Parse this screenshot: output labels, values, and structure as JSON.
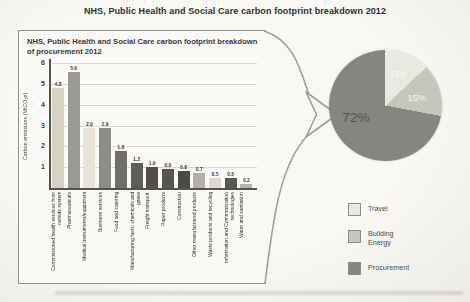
{
  "page": {
    "title": "NHS, Public Health and Social Care carbon footprint breakdown 2012"
  },
  "panel": {
    "title": "NHS, Public Health and Social Care carbon footprint breakdown of procurement 2012"
  },
  "colors": {
    "panel_border": "#91908a",
    "axis": "#55534e",
    "gridline": "#dad8d1",
    "page_background": "#f5f4ef"
  },
  "chart_data": [
    {
      "type": "bar",
      "title": "NHS, Public Health and Social Care carbon footprint breakdown of procurement 2012",
      "ylabel": "Carbon emissions (MtCO₂e)",
      "ylim": [
        0,
        6
      ],
      "yticks": [
        1,
        2,
        3,
        4,
        5,
        6
      ],
      "grid": true,
      "categories": [
        "Commissioned health services from outside system",
        "Pharmaceuticals",
        "Medical instruments/equipment",
        "Business services",
        "Food and catering",
        "Manufacturing fuels, chemicals and gases",
        "Freight transport",
        "Paper products",
        "Construction",
        "Other manufactured products",
        "Waste products and recycling",
        "Information and Communication technologies",
        "Water and sanitation"
      ],
      "values": [
        4.8,
        5.6,
        2.9,
        2.9,
        1.8,
        1.2,
        1.0,
        0.9,
        0.8,
        0.7,
        0.5,
        0.5,
        0.2
      ],
      "value_labels": [
        "4.8",
        "5.6",
        "2.9",
        "2.9",
        "1.8",
        "1.2",
        "1.0",
        "0.9",
        "0.8",
        "0.7",
        "0.5",
        "0.5",
        "0.2"
      ],
      "bar_colors": [
        "#d6d2c4",
        "#9a9994",
        "#e7e4d8",
        "#8d8c86",
        "#6f6e68",
        "#605e58",
        "#524f4a",
        "#575550",
        "#4c4a45",
        "#b3b0a8",
        "#dcd9d1",
        "#5a5853",
        "#b7b4ac"
      ]
    },
    {
      "type": "pie",
      "start_angle_deg": 0,
      "legend_position": "bottom-right",
      "slices": [
        {
          "name": "Travel",
          "value": 13,
          "label": "13%",
          "color": "#eae9e1",
          "label_color": "rgba(255,255,255,0.8)"
        },
        {
          "name": "Building Energy",
          "value": 15,
          "label": "15%",
          "color": "#c7c6bc",
          "label_color": "#f8f7f0"
        },
        {
          "name": "Procurement",
          "value": 72,
          "label": "72%",
          "color": "#868680",
          "label_color": "#54534e"
        }
      ]
    }
  ]
}
